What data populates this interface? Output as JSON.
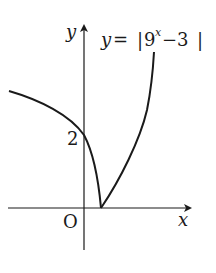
{
  "diagram": {
    "equation": {
      "lhs": "y",
      "eq": "=",
      "bar_left": "|",
      "base": "9",
      "exponent": "x",
      "rest": "−3",
      "bar_right": "|"
    },
    "axes": {
      "x_label": "x",
      "y_label": "y",
      "origin_label": "O"
    },
    "ticks": {
      "y_intercept_label": "2"
    },
    "colors": {
      "stroke": "#1a1a1a",
      "background": "#ffffff"
    }
  }
}
